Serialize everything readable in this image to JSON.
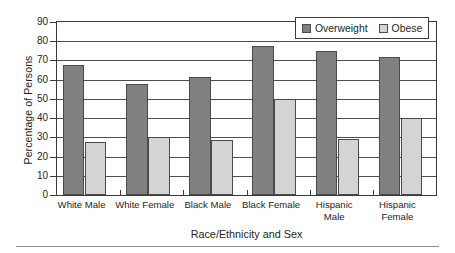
{
  "chart_data": {
    "type": "bar",
    "title": "",
    "xlabel": "Race/Ethnicity and Sex",
    "ylabel": "Percentage of Persons",
    "categories": [
      "White Male",
      "White Female",
      "Black Male",
      "Black Female",
      "Hispanic\nMale",
      "Hispanic\nFemale"
    ],
    "category_lines": [
      [
        "White Male"
      ],
      [
        "White Female"
      ],
      [
        "Black Male"
      ],
      [
        "Black Female"
      ],
      [
        "Hispanic",
        "Male"
      ],
      [
        "Hispanic",
        "Female"
      ]
    ],
    "series": [
      {
        "name": "Overweight",
        "color": "#808080",
        "values": [
          67.5,
          57.5,
          61.5,
          77.5,
          75.0,
          72.0
        ]
      },
      {
        "name": "Obese",
        "color": "#d4d4d4",
        "values": [
          27.5,
          30.0,
          28.5,
          50.0,
          29.0,
          40.0
        ]
      }
    ],
    "ylim": [
      0,
      90
    ],
    "ytick_labels": [
      "90",
      "80",
      "70",
      "60",
      "50",
      "40",
      "30",
      "20",
      "10",
      "0"
    ],
    "ytick_values": [
      90,
      80,
      70,
      60,
      50,
      40,
      30,
      20,
      10,
      0
    ],
    "ytick_step": 10,
    "grid": "horizontal",
    "legend_position": "top-right",
    "legend_entries": [
      "Overweight",
      "Obese"
    ]
  },
  "legend": {
    "overweight_label": "Overweight",
    "obese_label": "Obese"
  },
  "axes": {
    "y_title": "Percentage of Persons",
    "x_title": "Race/Ethnicity and Sex"
  }
}
